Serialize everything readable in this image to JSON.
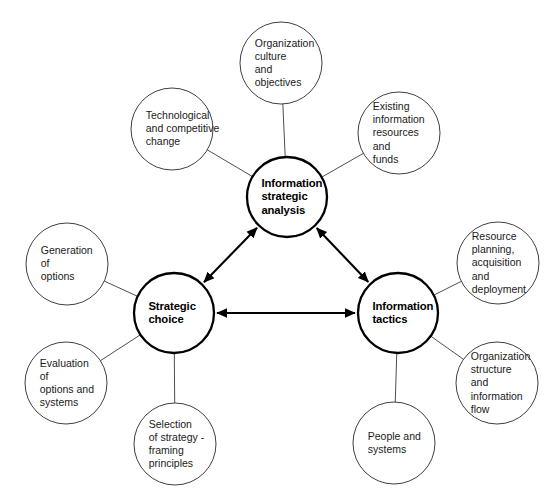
{
  "diagram": {
    "type": "hub-and-spoke network diagram",
    "background_color": "#ffffff",
    "stroke_color": "#1a1a1a",
    "core_stroke_color": "#000000",
    "core_nodes": [
      {
        "id": "information-strategic-analysis",
        "label": "Information\nstrategic\nanalysis",
        "cx": 287,
        "cy": 197,
        "r": 40
      },
      {
        "id": "strategic-choice",
        "label": "Strategic\nchoice",
        "cx": 174,
        "cy": 313,
        "r": 40
      },
      {
        "id": "information-tactics",
        "label": "Information\ntactics",
        "cx": 398,
        "cy": 313,
        "r": 40
      }
    ],
    "satellite_nodes": [
      {
        "id": "organization-culture-and-objectives",
        "label": "Organization\nculture\nand\nobjectives",
        "cx": 281,
        "cy": 63,
        "r": 41,
        "parent": "information-strategic-analysis"
      },
      {
        "id": "technological-and-competitive-change",
        "label": "Technological\nand competitive\nchange",
        "cx": 172,
        "cy": 129,
        "r": 41,
        "parent": "information-strategic-analysis"
      },
      {
        "id": "existing-information-resources-and-funds",
        "label": "Existing\ninformation\nresources\nand\nfunds",
        "cx": 399,
        "cy": 133,
        "r": 41,
        "parent": "information-strategic-analysis"
      },
      {
        "id": "resource-planning-acquisition-and-deployment",
        "label": "Resource\nplanning,\nacquisition\nand\ndeployment",
        "cx": 498,
        "cy": 263,
        "r": 41,
        "parent": "information-tactics"
      },
      {
        "id": "organization-structure-and-information-flow",
        "label": "Organization\nstructure\nand\ninformation\nflow",
        "cx": 497,
        "cy": 383,
        "r": 41,
        "parent": "information-tactics"
      },
      {
        "id": "people-and-systems",
        "label": "People and\nsystems",
        "cx": 394,
        "cy": 443,
        "r": 41,
        "parent": "information-tactics"
      },
      {
        "id": "selection-of-strategy-framing-principles",
        "label": "Selection\nof strategy -\nframing\nprinciples",
        "cx": 175,
        "cy": 444,
        "r": 41,
        "parent": "strategic-choice"
      },
      {
        "id": "evaluation-of-options-and-systems",
        "label": "Evaluation\nof\noptions and\nsystems",
        "cx": 66,
        "cy": 383,
        "r": 41,
        "parent": "strategic-choice"
      },
      {
        "id": "generation-of-options",
        "label": "Generation\nof\noptions",
        "cx": 67,
        "cy": 264,
        "r": 41,
        "parent": "strategic-choice"
      }
    ],
    "connectors": [
      {
        "id": "analysis-to-choice",
        "from": "information-strategic-analysis",
        "to": "strategic-choice",
        "style": "double-arrow",
        "weight": "bold"
      },
      {
        "id": "analysis-to-tactics",
        "from": "information-strategic-analysis",
        "to": "information-tactics",
        "style": "double-arrow",
        "weight": "bold"
      },
      {
        "id": "choice-to-tactics",
        "from": "strategic-choice",
        "to": "information-tactics",
        "style": "double-arrow",
        "weight": "bold"
      }
    ],
    "caption": {
      "text": "",
      "visible": false
    }
  }
}
